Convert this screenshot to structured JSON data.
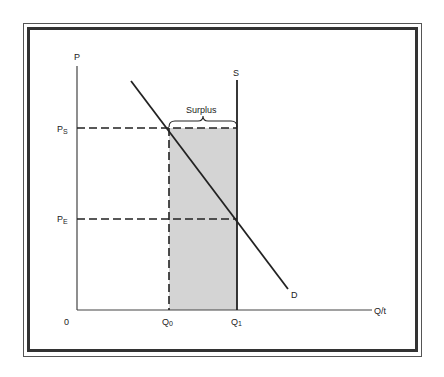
{
  "diagram": {
    "type": "supply-demand-price-floor",
    "labels": {
      "y_axis": "P",
      "x_axis": "Q/t",
      "origin": "0",
      "supply": "S",
      "demand": "D",
      "surplus": "Surplus",
      "price_support": "P",
      "price_support_sub": "S",
      "price_equilibrium": "P",
      "price_equilibrium_sub": "E",
      "q0": "Q",
      "q0_sub": "0",
      "q1": "Q",
      "q1_sub": "1"
    },
    "colors": {
      "line": "#222222",
      "shaded_area": "#d4d4d4",
      "frame": "#333333"
    }
  }
}
